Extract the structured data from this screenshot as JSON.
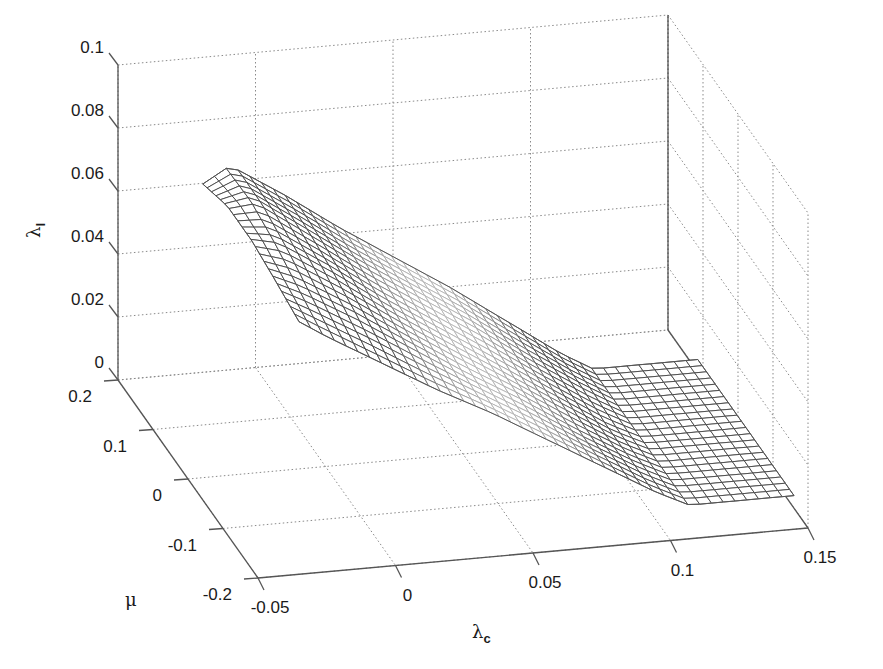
{
  "chart_data": {
    "type": "surface",
    "title": "",
    "xlabel": "λ",
    "xlabel_sub": "c",
    "ylabel": "μ",
    "zlabel": "λ",
    "zlabel_sub": "l",
    "xlim": [
      -0.05,
      0.15
    ],
    "ylim": [
      -0.2,
      0.2
    ],
    "zlim": [
      0,
      0.1
    ],
    "xticks": [
      -0.05,
      0,
      0.05,
      0.1,
      0.15
    ],
    "xtick_labels": [
      "-0.05",
      "0",
      "0.05",
      "0.1",
      "0.15"
    ],
    "yticks": [
      0.2,
      0.1,
      0,
      -0.1,
      -0.2
    ],
    "ytick_labels": [
      "0.2",
      "0.1",
      "0",
      "-0.1",
      "-0.2"
    ],
    "zticks": [
      0,
      0.02,
      0.04,
      0.06,
      0.08,
      0.1
    ],
    "ztick_labels": [
      "0",
      "0.02",
      "0.04",
      "0.06",
      "0.08",
      "0.1"
    ],
    "grid": true,
    "mesh_color": "#5a5a5a",
    "surface": {
      "lambda_c": [
        -0.03,
        -0.02,
        0.0,
        0.02,
        0.04,
        0.06,
        0.08,
        0.1,
        0.112,
        0.13,
        0.15
      ],
      "mu": [
        0.115,
        0.045,
        -0.025,
        -0.09,
        -0.16
      ],
      "z": [
        [
          0.074,
          0.079,
          0.068,
          0.056,
          0.045,
          0.034,
          0.022,
          0.01,
          0.004,
          0.004,
          0.004
        ],
        [
          0.078,
          0.079,
          0.067,
          0.055,
          0.044,
          0.033,
          0.021,
          0.01,
          0.004,
          0.004,
          0.004
        ],
        [
          0.078,
          0.076,
          0.065,
          0.053,
          0.042,
          0.031,
          0.02,
          0.009,
          0.004,
          0.004,
          0.004
        ],
        [
          0.076,
          0.072,
          0.062,
          0.051,
          0.04,
          0.03,
          0.019,
          0.009,
          0.004,
          0.004,
          0.004
        ],
        [
          0.0735,
          0.068,
          0.058,
          0.048,
          0.039,
          0.029,
          0.019,
          0.009,
          0.004,
          0.004,
          0.004
        ]
      ]
    }
  }
}
